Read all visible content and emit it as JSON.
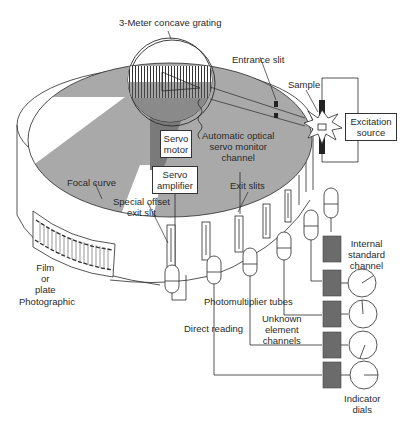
{
  "labels": {
    "grating": "3-Meter concave grating",
    "entrance_slit": "Entrance slit",
    "sample": "Sample",
    "excitation_source_l1": "Excitation",
    "excitation_source_l2": "source",
    "servo_motor_l1": "Servo",
    "servo_motor_l2": "motor",
    "servo_monitor_l1": "Automatic optical",
    "servo_monitor_l2": "servo monitor",
    "servo_monitor_l3": "channel",
    "servo_amplifier_l1": "Servo",
    "servo_amplifier_l2": "amplifier",
    "focal_curve": "Focal curve",
    "exit_slits": "Exit slits",
    "special_offset_l1": "Special offset",
    "special_offset_l2": "exit slit",
    "film_l1": "Film",
    "film_l2": "or",
    "film_l3": "plate",
    "photographic": "Photographic",
    "photomultiplier_tubes": "Photomultiplier tubes",
    "internal_standard_l1": "Internal",
    "internal_standard_l2": "standard",
    "internal_standard_l3": "channel",
    "unknown_channels_l1": "Unknown",
    "unknown_channels_l2": "element",
    "unknown_channels_l3": "channels",
    "direct_reading": "Direct reading",
    "indicator_dials_l1": "Indicator",
    "indicator_dials_l2": "dials"
  },
  "colors": {
    "line": "#2a2a2a",
    "shade": "#a9a9a9",
    "shade_dark": "#7a7a7a",
    "box_dark": "#6b6b6b",
    "background": "#ffffff"
  },
  "components": {
    "channel_boxes": 5,
    "indicator_dials": 4,
    "photomultiplier_tubes": 7
  }
}
